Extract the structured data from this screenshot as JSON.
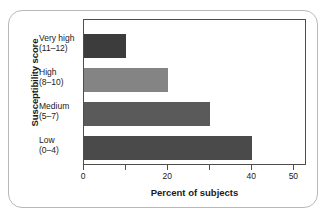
{
  "chart_data": {
    "type": "bar",
    "orientation": "horizontal",
    "title": "",
    "xlabel": "Percent of subjects",
    "ylabel": "Susceptibility score",
    "categories": [
      "Very high",
      "High",
      "Medium",
      "Low"
    ],
    "category_ranges": [
      "(11–12)",
      "(8–10)",
      "(5–7)",
      "(0–4)"
    ],
    "values": [
      10,
      20,
      30,
      40
    ],
    "bar_colors": [
      "#3c3c3c",
      "#848484",
      "#5a5a5a",
      "#4a4a4a"
    ],
    "xlim": [
      0,
      53
    ],
    "xticks": [
      0,
      10,
      20,
      30,
      40,
      50
    ],
    "xtick_labels": [
      "0",
      "",
      "20",
      "",
      "40",
      "50"
    ],
    "grid": false,
    "legend": "none"
  }
}
